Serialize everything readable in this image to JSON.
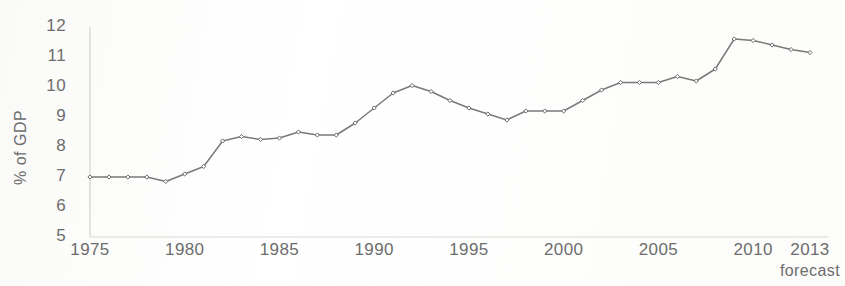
{
  "chart_data": {
    "type": "line",
    "title": "",
    "subtitle": "",
    "xlabel": "",
    "ylabel": "% of GDP",
    "xlim": [
      1975,
      2013
    ],
    "ylim": [
      5,
      12
    ],
    "grid": false,
    "legend": null,
    "x_tick_labels": [
      "1975",
      "1980",
      "1985",
      "1990",
      "1995",
      "2000",
      "2005",
      "2010",
      "2013"
    ],
    "x_ticks": [
      1975,
      1980,
      1985,
      1990,
      1995,
      2000,
      2005,
      2010,
      2013
    ],
    "y_tick_labels": [
      "12",
      "11",
      "10",
      "9",
      "8",
      "7",
      "6",
      "5"
    ],
    "y_ticks": [
      12,
      11,
      10,
      9,
      8,
      7,
      6,
      5
    ],
    "annotations": [
      {
        "text": "forecast",
        "x": 2013,
        "position": "below-axis"
      }
    ],
    "series": [
      {
        "name": "% of GDP",
        "color": "#7a7a7a",
        "marker": "diamond",
        "x": [
          1975,
          1976,
          1977,
          1978,
          1979,
          1980,
          1981,
          1982,
          1983,
          1984,
          1985,
          1986,
          1987,
          1988,
          1989,
          1990,
          1991,
          1992,
          1993,
          1994,
          1995,
          1996,
          1997,
          1998,
          1999,
          2000,
          2001,
          2002,
          2003,
          2004,
          2005,
          2006,
          2007,
          2008,
          2009,
          2010,
          2011,
          2012,
          2013
        ],
        "values": [
          7.0,
          7.0,
          7.0,
          7.0,
          6.85,
          7.1,
          7.35,
          8.2,
          8.35,
          8.25,
          8.3,
          8.5,
          8.4,
          8.4,
          8.8,
          9.3,
          9.8,
          10.05,
          9.85,
          9.55,
          9.3,
          9.1,
          8.9,
          9.2,
          9.2,
          9.2,
          9.55,
          9.9,
          10.15,
          10.15,
          10.15,
          10.35,
          10.2,
          10.6,
          11.6,
          11.55,
          11.4,
          11.25,
          11.15
        ]
      }
    ]
  },
  "style": {
    "line_color": "#7a7a7a",
    "marker_color": "#6a6a6a",
    "axis_color": "#d8d8d6",
    "text_color": "#6d6d6d",
    "background": "#fdfdfc"
  }
}
